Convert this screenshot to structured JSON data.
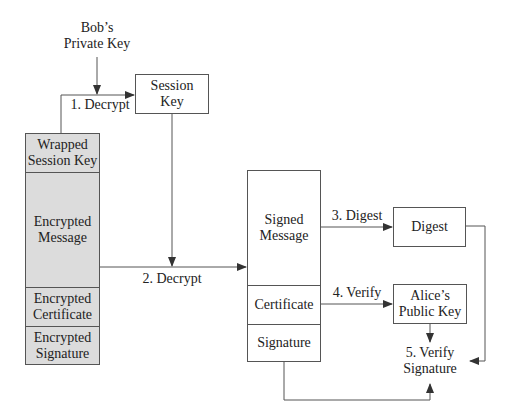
{
  "diagram": {
    "inputs": {
      "bobs_private_key": [
        "Bob’s",
        "Private Key"
      ]
    },
    "session_key": [
      "Session",
      "Key"
    ],
    "encrypted_package": [
      {
        "label": [
          "Wrapped",
          "Session Key"
        ]
      },
      {
        "label": [
          "Encrypted",
          "Message"
        ]
      },
      {
        "label": [
          "Encrypted",
          "Certificate"
        ]
      },
      {
        "label": [
          "Encrypted",
          "Signature"
        ]
      }
    ],
    "decrypted_package": [
      {
        "label": [
          "Signed",
          "Message"
        ]
      },
      {
        "label": [
          "Certificate"
        ]
      },
      {
        "label": [
          "Signature"
        ]
      }
    ],
    "digest": [
      "Digest"
    ],
    "alices_public_key": [
      "Alice’s",
      "Public Key"
    ],
    "verify_signature": [
      "5. Verify",
      "Signature"
    ],
    "steps": {
      "step1": "1. Decrypt",
      "step2": "2. Decrypt",
      "step3": "3. Digest",
      "step4": "4. Verify"
    },
    "colors": {
      "encrypted_fill": "#dcdcdc",
      "line": "#555555"
    }
  }
}
